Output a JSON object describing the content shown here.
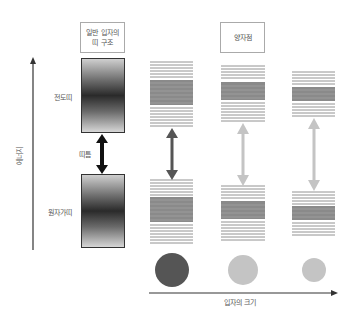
{
  "labels": {
    "bulk_title": "일반 입자의\n띠 구조",
    "bulk_title_line1": "일반 입자의",
    "bulk_title_line2": "띠 구조",
    "qd_title": "양자점",
    "conduction_band": "전도띠",
    "valence_band": "원자가띠",
    "band_gap": "띠틈",
    "y_axis": "에너지",
    "x_axis": "입자의 크기"
  },
  "colors": {
    "bulk_arrow": "#111111",
    "large_qd": "#555555",
    "small_qd": "#c4c4c4",
    "band_lines": "#777777",
    "axis": "#333333"
  },
  "columns": [
    {
      "name": "bulk",
      "type": "continuous-band"
    },
    {
      "name": "large-quantum-dot",
      "circle_radius": 17,
      "circle_color": "#555555",
      "arrow_color": "#555555"
    },
    {
      "name": "medium-quantum-dot",
      "circle_radius": 15,
      "circle_color": "#c4c4c4",
      "arrow_color": "#c4c4c4"
    },
    {
      "name": "small-quantum-dot",
      "circle_radius": 12,
      "circle_color": "#c4c4c4",
      "arrow_color": "#c4c4c4"
    }
  ]
}
